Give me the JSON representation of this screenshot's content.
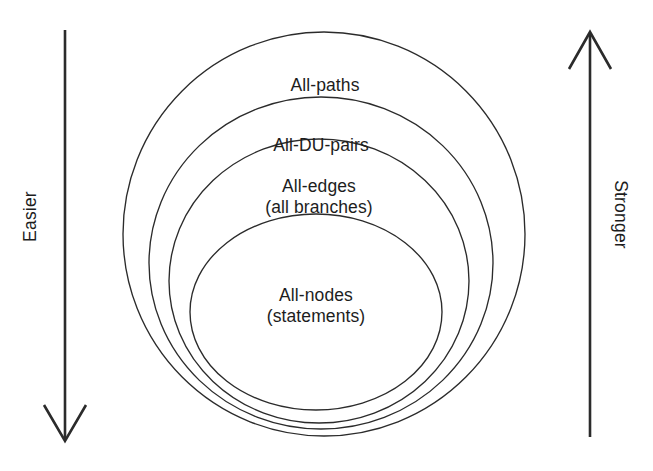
{
  "figure": {
    "background_color": "#ffffff",
    "stroke_color": "#2b2b2b",
    "text_color": "#1d1d1d"
  },
  "regions": [
    {
      "id": "all-paths",
      "label_line1": "All-paths",
      "label_line2": "",
      "level": 1
    },
    {
      "id": "all-du-pairs",
      "label_line1": "All-DU-pairs",
      "label_line2": "",
      "level": 2
    },
    {
      "id": "all-edges",
      "label_line1": "All-edges",
      "label_line2": "(all branches)",
      "level": 3
    },
    {
      "id": "all-nodes",
      "label_line1": "All-nodes",
      "label_line2": "(statements)",
      "level": 4
    }
  ],
  "axes": {
    "left": {
      "label": "Easier",
      "direction": "down"
    },
    "right": {
      "label": "Stronger",
      "direction": "up"
    }
  }
}
